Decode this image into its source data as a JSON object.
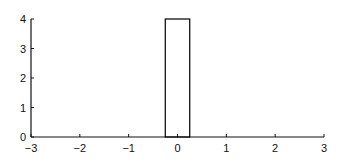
{
  "chart_data": {
    "type": "bar",
    "title": "",
    "xlabel": "",
    "ylabel": "",
    "xlim": [
      -3,
      3
    ],
    "ylim": [
      0,
      4
    ],
    "grid": false,
    "legend": null,
    "x_ticks": [
      "−3",
      "−2",
      "−1",
      "0",
      "1",
      "2",
      "3"
    ],
    "y_ticks": [
      "0",
      "1",
      "2",
      "3",
      "4"
    ],
    "bars": [
      {
        "x_start": -0.25,
        "x_end": 0.25,
        "height": 4,
        "fill": "none",
        "stroke": "#111111"
      }
    ]
  },
  "colors": {
    "axis": "#111111",
    "bar_stroke": "#111111",
    "background": "#ffffff"
  }
}
